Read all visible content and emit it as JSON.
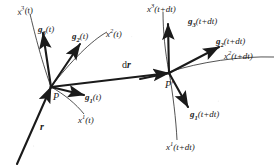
{
  "figure": {
    "type": "diagram",
    "background_color": "#ffffff",
    "ink_color": "#1a1a1a",
    "width": 280,
    "height": 166
  },
  "points": {
    "p": {
      "label": "P",
      "x": 50,
      "y": 88
    },
    "p_prime": {
      "label": "P",
      "prime": "'",
      "x": 170,
      "y": 73
    }
  },
  "displacement": {
    "label_d": "d",
    "label_r": "r",
    "full": "dr",
    "x": 122,
    "y": 68
  },
  "position_vector": {
    "label": "r",
    "x": 40,
    "y": 128
  },
  "labels_left": [
    {
      "name": "coord-curve-x3-t",
      "base": "x",
      "sup": "3",
      "arg": "(t)",
      "x": 18,
      "y": 8,
      "bold": false
    },
    {
      "name": "basis-vector-g3-t",
      "base": "g",
      "sub": "3",
      "arg": "(t)",
      "x": 38,
      "y": 25,
      "bold": true
    },
    {
      "name": "basis-vector-g2-t",
      "base": "g",
      "sub": "2",
      "arg": "(t)",
      "x": 72,
      "y": 32,
      "bold": true
    },
    {
      "name": "coord-curve-x2-t",
      "base": "x",
      "sup": "2",
      "arg": "(t)",
      "x": 106,
      "y": 30,
      "bold": false
    },
    {
      "name": "basis-vector-g1-t",
      "base": "g",
      "sub": "1",
      "arg": "(t)",
      "x": 85,
      "y": 93,
      "bold": true
    },
    {
      "name": "coord-curve-x1-t",
      "base": "x",
      "sup": "1",
      "arg": "(t)",
      "x": 78,
      "y": 116,
      "bold": false
    }
  ],
  "labels_right": [
    {
      "name": "coord-curve-x3-tdt",
      "base": "x",
      "sup": "3",
      "arg": "(t+dt)",
      "x": 147,
      "y": 5,
      "bold": false
    },
    {
      "name": "basis-vector-g3-tdt",
      "base": "g",
      "sub": "3",
      "arg": "(t+dt)",
      "x": 188,
      "y": 17,
      "bold": true
    },
    {
      "name": "basis-vector-g2-tdt",
      "base": "g",
      "sub": "2",
      "arg": "(t+dt)",
      "x": 216,
      "y": 37,
      "bold": true
    },
    {
      "name": "coord-curve-x2-tdt",
      "base": "x",
      "sup": "2",
      "arg": "(t+dt)",
      "x": 226,
      "y": 52,
      "bold": false
    },
    {
      "name": "basis-vector-g1-tdt",
      "base": "g",
      "sub": "1",
      "arg": "(t+dt)",
      "x": 190,
      "y": 110,
      "bold": true
    },
    {
      "name": "coord-curve-x1-tdt",
      "base": "x",
      "sup": "1",
      "arg": "(t+dt)",
      "x": 168,
      "y": 143,
      "bold": false
    }
  ]
}
